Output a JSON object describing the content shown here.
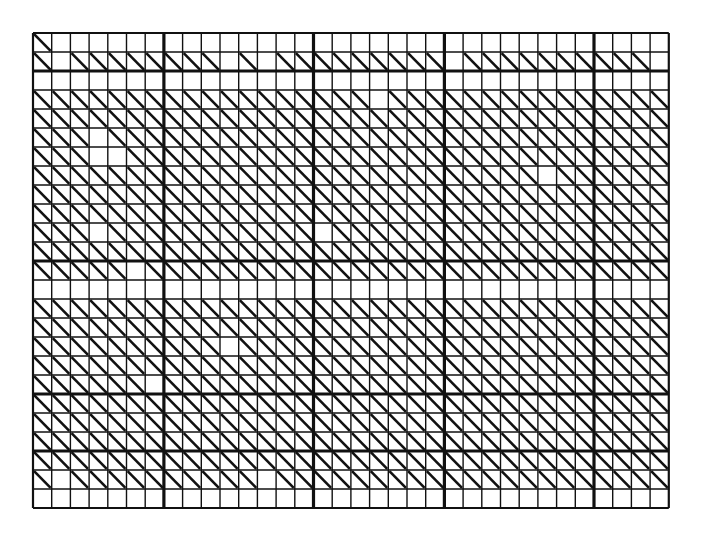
{
  "figure": {
    "kind": "grid-diagram",
    "background_color": "#ffffff",
    "ink_color": "#111111"
  },
  "grid": {
    "origin_x": 33,
    "origin_y": 33,
    "cell_width": 18.7,
    "cell_height": 19.0,
    "columns": 34,
    "rows": 25,
    "thin_line_width": 1.4,
    "thick_line_width": 3.2,
    "border_line_width": 2.2,
    "diagonal_line_width": 2.6,
    "diagonal_direction": "top-left-to-bottom-right",
    "thick_vertical_indices": [
      0,
      7,
      15,
      22,
      30,
      34
    ],
    "thick_horizontal_indices": [
      0,
      2,
      12,
      19,
      22,
      25
    ],
    "cell_diagonals": [
      "1000000000000000000000000000000000",
      "1011111111010111111111011111111110",
      "0000000000000000000000000000000000",
      "1111111111111111110111111111111111",
      "1111111111111111111111111111111111",
      "1110111111111111111111111111111111",
      "1110011111111111111111111111111111",
      "1111111111111111111111111110111111",
      "1111111111111111111111111111111111",
      "1111111111111111111111111111111111",
      "1110111111111110111111111111111111",
      "1111111111111111111111111111111111",
      "1111101111111111111111111111111111",
      "0000000000000000000000000000000000",
      "1111111111111111111111111111111111",
      "1111111111111111111111111111111111",
      "1111111111011111111111111111111111",
      "1111111111111111111111111111111111",
      "1111110111111111111111111111111111",
      "1111111111111111111111111111111111",
      "1111111111111111111111111111111111",
      "1111111111111111111111111111111111",
      "1111111111111111111111111111111111",
      "1011111111110111111111111111111111",
      "0000000000000000000000000000000000"
    ]
  },
  "chart_data": {
    "type": "heatmap",
    "xlabel": "",
    "ylabel": "",
    "grid": true,
    "legend": "none",
    "columns": 34,
    "rows": 25,
    "cell_glyph": "diagonal-backslash",
    "values_note": "1 = cell contains a diagonal stroke, 0 = empty cell",
    "matrix": [
      "1000000000000000000000000000000000",
      "1011111111010111111111011111111110",
      "0000000000000000000000000000000000",
      "1111111111111111110111111111111111",
      "1111111111111111111111111111111111",
      "1110111111111111111111111111111111",
      "1110011111111111111111111111111111",
      "1111111111111111111111111110111111",
      "1111111111111111111111111111111111",
      "1111111111111111111111111111111111",
      "1110111111111110111111111111111111",
      "1111111111111111111111111111111111",
      "1111101111111111111111111111111111",
      "0000000000000000000000000000000000",
      "1111111111111111111111111111111111",
      "1111111111111111111111111111111111",
      "1111111111011111111111111111111111",
      "1111111111111111111111111111111111",
      "1111110111111111111111111111111111",
      "1111111111111111111111111111111111",
      "1111111111111111111111111111111111",
      "1111111111111111111111111111111111",
      "1111111111111111111111111111111111",
      "1011111111110111111111111111111111",
      "0000000000000000000000000000000000"
    ]
  }
}
